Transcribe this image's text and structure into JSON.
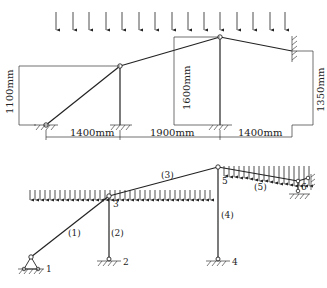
{
  "top_diagram": {
    "dimensions": {
      "h_left": "1100mm",
      "h_mid": "1600mm",
      "h_right": "1350mm",
      "span_1": "1400mm",
      "span_2": "1900mm",
      "span_3": "1400mm"
    }
  },
  "bottom_diagram": {
    "nodes": [
      "1",
      "2",
      "3",
      "4",
      "5",
      "6"
    ],
    "members": [
      "(1)",
      "(2)",
      "(3)",
      "(4)",
      "(5)"
    ]
  },
  "colors": {
    "line": "#222222",
    "background": "#ffffff"
  }
}
